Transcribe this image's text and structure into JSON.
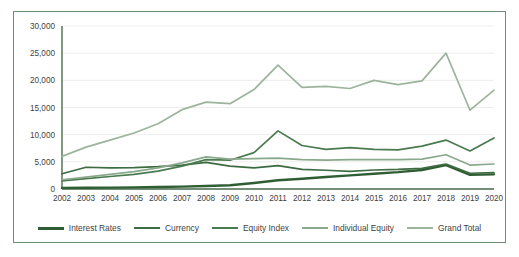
{
  "chart_data": {
    "type": "line",
    "title": "",
    "xlabel": "",
    "ylabel": "",
    "grid": true,
    "legend_position": "bottom",
    "ylim": [
      0,
      30000
    ],
    "yticks": [
      0,
      5000,
      10000,
      15000,
      20000,
      25000,
      30000
    ],
    "ytick_labels": [
      "0",
      "5,000",
      "10,000",
      "15,000",
      "20,000",
      "25,000",
      "30,000"
    ],
    "categories": [
      "2002",
      "2003",
      "2004",
      "2005",
      "2006",
      "2007",
      "2008",
      "2009",
      "2010",
      "2011",
      "2012",
      "2013",
      "2014",
      "2015",
      "2016",
      "2017",
      "2018",
      "2019",
      "2020"
    ],
    "series": [
      {
        "name": "Interest Rates",
        "color": "#2f5e34",
        "width": 2.4,
        "values": [
          200,
          230,
          260,
          300,
          360,
          430,
          560,
          700,
          1100,
          1600,
          1900,
          2200,
          2500,
          2800,
          3100,
          3500,
          4400,
          2600,
          2700
        ]
      },
      {
        "name": "Currency",
        "color": "#3d6b42",
        "width": 1.7,
        "values": [
          2800,
          4000,
          3900,
          3950,
          4100,
          4400,
          4900,
          4200,
          3900,
          4300,
          3600,
          3450,
          3250,
          3500,
          3600,
          3800,
          4600,
          2900,
          3000
        ]
      },
      {
        "name": "Equity Index",
        "color": "#4a7a4f",
        "width": 1.7,
        "values": [
          1500,
          1900,
          2300,
          2700,
          3300,
          4200,
          5400,
          5300,
          6700,
          10700,
          8000,
          7300,
          7600,
          7300,
          7200,
          7900,
          9000,
          7000,
          9400
        ]
      },
      {
        "name": "Individual Equity",
        "color": "#8aa98c",
        "width": 1.7,
        "values": [
          1700,
          2200,
          2700,
          3200,
          3900,
          4800,
          5900,
          5500,
          5600,
          5700,
          5400,
          5300,
          5400,
          5400,
          5400,
          5500,
          6300,
          4400,
          4600
        ]
      },
      {
        "name": "Grand Total",
        "color": "#9db49c",
        "width": 1.7,
        "values": [
          6000,
          7700,
          9000,
          10300,
          12000,
          14600,
          16000,
          15700,
          18300,
          22800,
          18700,
          18900,
          18500,
          20000,
          19200,
          19900,
          25000,
          14500,
          18200
        ]
      }
    ]
  }
}
